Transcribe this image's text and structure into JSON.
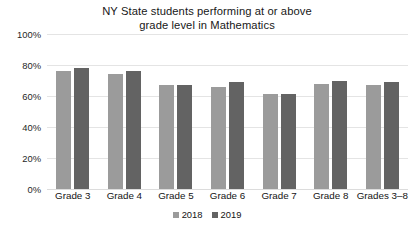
{
  "chart_data": {
    "type": "bar",
    "title": "NY State students performing at or above grade level in Mathematics",
    "title_lines": [
      "NY State students performing at or above",
      "grade level in Mathematics"
    ],
    "xlabel": "",
    "ylabel": "",
    "ylim": [
      0,
      100
    ],
    "y_ticks": [
      "0%",
      "20%",
      "40%",
      "60%",
      "80%",
      "100%"
    ],
    "y_tick_values": [
      0,
      20,
      40,
      60,
      80,
      100
    ],
    "grid": true,
    "legend_position": "bottom",
    "categories": [
      "Grade 3",
      "Grade 4",
      "Grade 5",
      "Grade 6",
      "Grade 7",
      "Grade 8",
      "Grades 3–8"
    ],
    "series": [
      {
        "name": "2018",
        "color": "#9b9b9b",
        "values": [
          76,
          74,
          67,
          66,
          61,
          68,
          67
        ]
      },
      {
        "name": "2019",
        "color": "#636363",
        "values": [
          78,
          76,
          67,
          69,
          61,
          70,
          69
        ]
      }
    ]
  },
  "legend": {
    "items": [
      {
        "label": "2018",
        "swatch": "legend-swatch-2018"
      },
      {
        "label": "2019",
        "swatch": "legend-swatch-2019"
      }
    ]
  }
}
